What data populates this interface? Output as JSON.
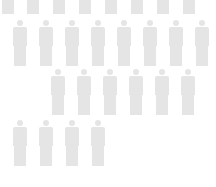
{
  "figure_color": "#e5e5e5",
  "background_color": "#ffffff",
  "icon": "person-icon",
  "rows": [
    {
      "name": "row-1",
      "count": 8,
      "top": -32,
      "centers": [
        8,
        33,
        59,
        85,
        111,
        137,
        163,
        189
      ]
    },
    {
      "name": "row-2",
      "count": 8,
      "top": 20,
      "centers": [
        20,
        46,
        72,
        98,
        124,
        150,
        176,
        202
      ]
    },
    {
      "name": "row-3",
      "count": 6,
      "top": 69,
      "centers": [
        58,
        84,
        110,
        136,
        162,
        188
      ]
    },
    {
      "name": "row-4",
      "count": 4,
      "top": 120,
      "centers": [
        20,
        46,
        72,
        98
      ]
    }
  ]
}
